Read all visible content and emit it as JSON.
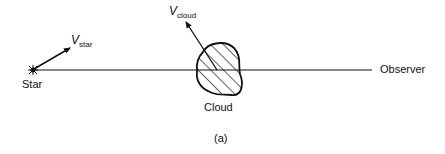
{
  "figure": {
    "caption": "(a)",
    "line_of_sight": {
      "from": "Star",
      "to": "Observer"
    },
    "labels": {
      "star": "Star",
      "cloud": "Cloud",
      "observer": "Observer",
      "v_star_main": "V",
      "v_star_sub": "star",
      "v_cloud_main": "V",
      "v_cloud_sub": "cloud"
    },
    "vectors": [
      {
        "name": "V_star",
        "origin": "Star",
        "direction": "up-right"
      },
      {
        "name": "V_cloud",
        "origin": "Cloud",
        "direction": "up-left"
      }
    ],
    "colors": {
      "ink": "#111111",
      "background": "#ffffff"
    }
  }
}
